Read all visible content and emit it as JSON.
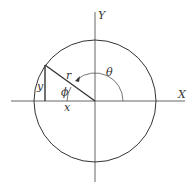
{
  "diagram": {
    "type": "polar-coordinates-circle",
    "labels": {
      "x_axis": "X",
      "y_axis": "Y",
      "radius": "r",
      "theta": "θ",
      "phi": "ϕ",
      "x_leg": "x",
      "y_leg": "y"
    },
    "colors": {
      "line": "#333333",
      "background": "#ffffff"
    }
  }
}
